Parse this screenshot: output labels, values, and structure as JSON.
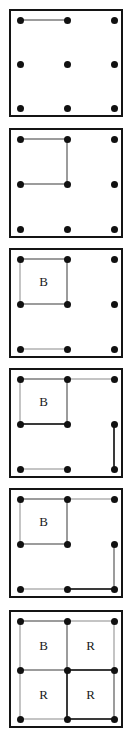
{
  "figure": {
    "panel_count": 6,
    "grid": {
      "dot_rows": 3,
      "dot_cols": 3,
      "cell_rows": 2,
      "cell_cols": 2
    },
    "colors": {
      "frame": "#141414",
      "dot": "#111111",
      "edge_default": "#9c9c9c",
      "edge_dark": "#3a3a3a",
      "edge_light": "#c4c4c4",
      "label": "#1a1a1a",
      "background": "#ffffff"
    },
    "dot_positions": [
      {
        "id": "d00",
        "col": 0,
        "row": 0
      },
      {
        "id": "d10",
        "col": 1,
        "row": 0
      },
      {
        "id": "d20",
        "col": 2,
        "row": 0
      },
      {
        "id": "d01",
        "col": 0,
        "row": 1
      },
      {
        "id": "d11",
        "col": 1,
        "row": 1
      },
      {
        "id": "d21",
        "col": 2,
        "row": 1
      },
      {
        "id": "d02",
        "col": 0,
        "row": 2
      },
      {
        "id": "d12",
        "col": 1,
        "row": 2
      },
      {
        "id": "d22",
        "col": 2,
        "row": 2
      }
    ],
    "panels": [
      {
        "index": 1,
        "edges": [
          {
            "orient": "h",
            "col": 0,
            "row": 0,
            "shade": "default"
          }
        ],
        "labels": []
      },
      {
        "index": 2,
        "edges": [
          {
            "orient": "h",
            "col": 0,
            "row": 0,
            "shade": "default"
          },
          {
            "orient": "v",
            "col": 1,
            "row": 0,
            "shade": "default"
          },
          {
            "orient": "h",
            "col": 0,
            "row": 1,
            "shade": "default"
          }
        ],
        "labels": []
      },
      {
        "index": 3,
        "edges": [
          {
            "orient": "h",
            "col": 0,
            "row": 0,
            "shade": "default"
          },
          {
            "orient": "v",
            "col": 1,
            "row": 0,
            "shade": "default"
          },
          {
            "orient": "h",
            "col": 0,
            "row": 1,
            "shade": "default"
          },
          {
            "orient": "v",
            "col": 0,
            "row": 0,
            "shade": "light"
          },
          {
            "orient": "h",
            "col": 0,
            "row": 2,
            "shade": "light"
          }
        ],
        "labels": [
          {
            "text": "B",
            "col": 0,
            "row": 0
          }
        ]
      },
      {
        "index": 4,
        "edges": [
          {
            "orient": "h",
            "col": 0,
            "row": 0,
            "shade": "default"
          },
          {
            "orient": "v",
            "col": 1,
            "row": 0,
            "shade": "default"
          },
          {
            "orient": "h",
            "col": 0,
            "row": 1,
            "shade": "dark"
          },
          {
            "orient": "v",
            "col": 0,
            "row": 0,
            "shade": "light"
          },
          {
            "orient": "h",
            "col": 0,
            "row": 2,
            "shade": "light"
          },
          {
            "orient": "h",
            "col": 1,
            "row": 0,
            "shade": "light"
          },
          {
            "orient": "v",
            "col": 2,
            "row": 1,
            "shade": "dark"
          }
        ],
        "labels": [
          {
            "text": "B",
            "col": 0,
            "row": 0
          }
        ]
      },
      {
        "index": 5,
        "edges": [
          {
            "orient": "h",
            "col": 0,
            "row": 0,
            "shade": "default"
          },
          {
            "orient": "v",
            "col": 1,
            "row": 0,
            "shade": "default"
          },
          {
            "orient": "h",
            "col": 0,
            "row": 1,
            "shade": "default"
          },
          {
            "orient": "v",
            "col": 0,
            "row": 0,
            "shade": "light"
          },
          {
            "orient": "h",
            "col": 0,
            "row": 2,
            "shade": "light"
          },
          {
            "orient": "h",
            "col": 1,
            "row": 0,
            "shade": "light"
          },
          {
            "orient": "v",
            "col": 2,
            "row": 1,
            "shade": "default"
          },
          {
            "orient": "h",
            "col": 1,
            "row": 2,
            "shade": "dark"
          }
        ],
        "labels": [
          {
            "text": "B",
            "col": 0,
            "row": 0
          }
        ]
      },
      {
        "index": 6,
        "edges": [
          {
            "orient": "h",
            "col": 0,
            "row": 0,
            "shade": "default"
          },
          {
            "orient": "h",
            "col": 1,
            "row": 0,
            "shade": "light"
          },
          {
            "orient": "v",
            "col": 0,
            "row": 0,
            "shade": "light"
          },
          {
            "orient": "v",
            "col": 1,
            "row": 0,
            "shade": "default"
          },
          {
            "orient": "v",
            "col": 2,
            "row": 0,
            "shade": "light"
          },
          {
            "orient": "h",
            "col": 0,
            "row": 1,
            "shade": "default"
          },
          {
            "orient": "h",
            "col": 1,
            "row": 1,
            "shade": "dark"
          },
          {
            "orient": "v",
            "col": 0,
            "row": 1,
            "shade": "light"
          },
          {
            "orient": "v",
            "col": 1,
            "row": 1,
            "shade": "dark"
          },
          {
            "orient": "v",
            "col": 2,
            "row": 1,
            "shade": "default"
          },
          {
            "orient": "h",
            "col": 0,
            "row": 2,
            "shade": "light"
          },
          {
            "orient": "h",
            "col": 1,
            "row": 2,
            "shade": "dark"
          }
        ],
        "labels": [
          {
            "text": "B",
            "col": 0,
            "row": 0
          },
          {
            "text": "R",
            "col": 1,
            "row": 0
          },
          {
            "text": "R",
            "col": 0,
            "row": 1
          },
          {
            "text": "R",
            "col": 1,
            "row": 1
          }
        ]
      }
    ]
  }
}
